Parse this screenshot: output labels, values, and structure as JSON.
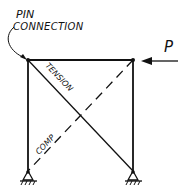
{
  "diagram": {
    "type": "braced-frame-truss",
    "labels": {
      "pin_connection_line1": "PIN",
      "pin_connection_line2": "CONNECTION",
      "tension": "TENSION",
      "compression": "COMP",
      "load": "P"
    },
    "members": [
      {
        "name": "top-chord",
        "from": [
          28,
          60
        ],
        "to": [
          133,
          60
        ],
        "style": "solid"
      },
      {
        "name": "left-column",
        "from": [
          28,
          60
        ],
        "to": [
          28,
          171
        ],
        "style": "solid"
      },
      {
        "name": "right-column",
        "from": [
          133,
          60
        ],
        "to": [
          133,
          171
        ],
        "style": "solid"
      },
      {
        "name": "tension-diagonal",
        "from": [
          28,
          60
        ],
        "to": [
          133,
          171
        ],
        "style": "solid",
        "force": "tension"
      },
      {
        "name": "compression-diagonal",
        "from": [
          133,
          60
        ],
        "to": [
          28,
          171
        ],
        "style": "dashed",
        "force": "compression"
      }
    ],
    "supports": [
      {
        "name": "left-pin-support",
        "at": [
          28,
          171
        ]
      },
      {
        "name": "right-pin-support",
        "at": [
          133,
          171
        ]
      }
    ],
    "load": {
      "direction": "left",
      "applied_at": [
        133,
        60
      ]
    },
    "colors": {
      "ink": "#111111",
      "background": "#ffffff"
    }
  }
}
